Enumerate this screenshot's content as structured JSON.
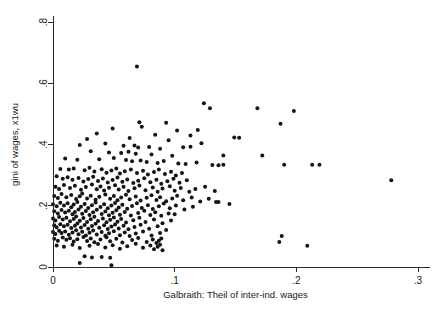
{
  "chart_data": {
    "type": "scatter",
    "title": "",
    "subtitle": "",
    "xlabel": "Galbraith: Theil of inter-ind. wages",
    "ylabel": "gini of wages, x1wu",
    "xlim": [
      0,
      0.3
    ],
    "ylim": [
      0,
      0.8
    ],
    "xticks": [
      0,
      0.1,
      0.2,
      0.3
    ],
    "xticklabels": [
      "0",
      ".1",
      ".2",
      ".3"
    ],
    "yticks": [
      0,
      0.2,
      0.4,
      0.6,
      0.8
    ],
    "yticklabels": [
      "0",
      ".2",
      ".4",
      ".6",
      ".8"
    ],
    "grid": false,
    "legend": null,
    "marker": "circle",
    "marker_color": "#151515",
    "marker_size": 4,
    "n_points": 362,
    "annotations": [],
    "points": [
      [
        0.069,
        0.655
      ],
      [
        0.124,
        0.535
      ],
      [
        0.129,
        0.518
      ],
      [
        0.168,
        0.518
      ],
      [
        0.198,
        0.509
      ],
      [
        0.187,
        0.468
      ],
      [
        0.071,
        0.473
      ],
      [
        0.093,
        0.471
      ],
      [
        0.049,
        0.452
      ],
      [
        0.073,
        0.458
      ],
      [
        0.102,
        0.446
      ],
      [
        0.119,
        0.447
      ],
      [
        0.036,
        0.436
      ],
      [
        0.084,
        0.432
      ],
      [
        0.113,
        0.429
      ],
      [
        0.149,
        0.423
      ],
      [
        0.153,
        0.422
      ],
      [
        0.028,
        0.418
      ],
      [
        0.063,
        0.421
      ],
      [
        0.095,
        0.414
      ],
      [
        0.122,
        0.404
      ],
      [
        0.022,
        0.398
      ],
      [
        0.043,
        0.403
      ],
      [
        0.058,
        0.396
      ],
      [
        0.067,
        0.397
      ],
      [
        0.07,
        0.39
      ],
      [
        0.079,
        0.392
      ],
      [
        0.088,
        0.386
      ],
      [
        0.107,
        0.391
      ],
      [
        0.113,
        0.393
      ],
      [
        0.031,
        0.378
      ],
      [
        0.046,
        0.374
      ],
      [
        0.056,
        0.372
      ],
      [
        0.062,
        0.376
      ],
      [
        0.068,
        0.37
      ],
      [
        0.081,
        0.367
      ],
      [
        0.098,
        0.363
      ],
      [
        0.14,
        0.364
      ],
      [
        0.172,
        0.364
      ],
      [
        0.01,
        0.354
      ],
      [
        0.02,
        0.35
      ],
      [
        0.038,
        0.352
      ],
      [
        0.05,
        0.356
      ],
      [
        0.06,
        0.349
      ],
      [
        0.065,
        0.345
      ],
      [
        0.072,
        0.348
      ],
      [
        0.077,
        0.343
      ],
      [
        0.086,
        0.34
      ],
      [
        0.091,
        0.346
      ],
      [
        0.103,
        0.338
      ],
      [
        0.109,
        0.336
      ],
      [
        0.118,
        0.341
      ],
      [
        0.006,
        0.32
      ],
      [
        0.013,
        0.318
      ],
      [
        0.017,
        0.322
      ],
      [
        0.026,
        0.316
      ],
      [
        0.03,
        0.324
      ],
      [
        0.034,
        0.312
      ],
      [
        0.04,
        0.319
      ],
      [
        0.044,
        0.308
      ],
      [
        0.048,
        0.315
      ],
      [
        0.052,
        0.322
      ],
      [
        0.055,
        0.305
      ],
      [
        0.059,
        0.313
      ],
      [
        0.064,
        0.318
      ],
      [
        0.069,
        0.307
      ],
      [
        0.074,
        0.314
      ],
      [
        0.078,
        0.302
      ],
      [
        0.083,
        0.31
      ],
      [
        0.087,
        0.318
      ],
      [
        0.092,
        0.304
      ],
      [
        0.097,
        0.311
      ],
      [
        0.101,
        0.299
      ],
      [
        0.106,
        0.307
      ],
      [
        0.131,
        0.333
      ],
      [
        0.136,
        0.332
      ],
      [
        0.14,
        0.334
      ],
      [
        0.19,
        0.334
      ],
      [
        0.213,
        0.334
      ],
      [
        0.219,
        0.334
      ],
      [
        0.278,
        0.283
      ],
      [
        0.003,
        0.296
      ],
      [
        0.008,
        0.288
      ],
      [
        0.012,
        0.293
      ],
      [
        0.016,
        0.285
      ],
      [
        0.021,
        0.291
      ],
      [
        0.025,
        0.279
      ],
      [
        0.029,
        0.287
      ],
      [
        0.033,
        0.295
      ],
      [
        0.037,
        0.281
      ],
      [
        0.041,
        0.289
      ],
      [
        0.045,
        0.276
      ],
      [
        0.049,
        0.284
      ],
      [
        0.053,
        0.292
      ],
      [
        0.057,
        0.278
      ],
      [
        0.061,
        0.286
      ],
      [
        0.066,
        0.274
      ],
      [
        0.07,
        0.282
      ],
      [
        0.075,
        0.29
      ],
      [
        0.08,
        0.277
      ],
      [
        0.085,
        0.285
      ],
      [
        0.089,
        0.272
      ],
      [
        0.094,
        0.28
      ],
      [
        0.099,
        0.288
      ],
      [
        0.104,
        0.275
      ],
      [
        0.11,
        0.283
      ],
      [
        0.002,
        0.262
      ],
      [
        0.005,
        0.255
      ],
      [
        0.009,
        0.268
      ],
      [
        0.014,
        0.258
      ],
      [
        0.018,
        0.265
      ],
      [
        0.023,
        0.252
      ],
      [
        0.027,
        0.261
      ],
      [
        0.032,
        0.269
      ],
      [
        0.036,
        0.254
      ],
      [
        0.039,
        0.263
      ],
      [
        0.042,
        0.25
      ],
      [
        0.046,
        0.259
      ],
      [
        0.051,
        0.267
      ],
      [
        0.054,
        0.253
      ],
      [
        0.058,
        0.262
      ],
      [
        0.062,
        0.248
      ],
      [
        0.067,
        0.257
      ],
      [
        0.071,
        0.266
      ],
      [
        0.076,
        0.251
      ],
      [
        0.082,
        0.26
      ],
      [
        0.086,
        0.246
      ],
      [
        0.09,
        0.256
      ],
      [
        0.096,
        0.264
      ],
      [
        0.1,
        0.249
      ],
      [
        0.105,
        0.258
      ],
      [
        0.112,
        0.246
      ],
      [
        0.117,
        0.255
      ],
      [
        0.125,
        0.262
      ],
      [
        0.133,
        0.248
      ],
      [
        0.001,
        0.232
      ],
      [
        0.004,
        0.225
      ],
      [
        0.007,
        0.238
      ],
      [
        0.011,
        0.228
      ],
      [
        0.015,
        0.235
      ],
      [
        0.019,
        0.222
      ],
      [
        0.022,
        0.231
      ],
      [
        0.024,
        0.24
      ],
      [
        0.028,
        0.224
      ],
      [
        0.031,
        0.233
      ],
      [
        0.035,
        0.22
      ],
      [
        0.038,
        0.229
      ],
      [
        0.043,
        0.237
      ],
      [
        0.047,
        0.223
      ],
      [
        0.05,
        0.232
      ],
      [
        0.053,
        0.218
      ],
      [
        0.056,
        0.227
      ],
      [
        0.06,
        0.236
      ],
      [
        0.063,
        0.221
      ],
      [
        0.068,
        0.23
      ],
      [
        0.072,
        0.217
      ],
      [
        0.077,
        0.226
      ],
      [
        0.081,
        0.234
      ],
      [
        0.085,
        0.219
      ],
      [
        0.088,
        0.228
      ],
      [
        0.093,
        0.215
      ],
      [
        0.098,
        0.224
      ],
      [
        0.102,
        0.233
      ],
      [
        0.107,
        0.218
      ],
      [
        0.114,
        0.227
      ],
      [
        0.121,
        0.214
      ],
      [
        0.128,
        0.223
      ],
      [
        0.136,
        0.212
      ],
      [
        0.145,
        0.206
      ],
      [
        0.134,
        0.212
      ],
      [
        0.0,
        0.205
      ],
      [
        0.003,
        0.198
      ],
      [
        0.006,
        0.21
      ],
      [
        0.009,
        0.201
      ],
      [
        0.012,
        0.208
      ],
      [
        0.015,
        0.195
      ],
      [
        0.017,
        0.204
      ],
      [
        0.02,
        0.212
      ],
      [
        0.023,
        0.197
      ],
      [
        0.026,
        0.206
      ],
      [
        0.029,
        0.193
      ],
      [
        0.032,
        0.202
      ],
      [
        0.035,
        0.211
      ],
      [
        0.039,
        0.196
      ],
      [
        0.042,
        0.205
      ],
      [
        0.045,
        0.192
      ],
      [
        0.048,
        0.201
      ],
      [
        0.051,
        0.209
      ],
      [
        0.054,
        0.194
      ],
      [
        0.057,
        0.203
      ],
      [
        0.061,
        0.19
      ],
      [
        0.065,
        0.199
      ],
      [
        0.069,
        0.208
      ],
      [
        0.073,
        0.193
      ],
      [
        0.078,
        0.202
      ],
      [
        0.082,
        0.189
      ],
      [
        0.087,
        0.198
      ],
      [
        0.091,
        0.207
      ],
      [
        0.096,
        0.192
      ],
      [
        0.101,
        0.201
      ],
      [
        0.108,
        0.188
      ],
      [
        0.115,
        0.197
      ],
      [
        0.001,
        0.182
      ],
      [
        0.004,
        0.175
      ],
      [
        0.007,
        0.186
      ],
      [
        0.01,
        0.178
      ],
      [
        0.013,
        0.184
      ],
      [
        0.016,
        0.172
      ],
      [
        0.018,
        0.18
      ],
      [
        0.021,
        0.188
      ],
      [
        0.024,
        0.174
      ],
      [
        0.027,
        0.183
      ],
      [
        0.03,
        0.17
      ],
      [
        0.033,
        0.179
      ],
      [
        0.036,
        0.187
      ],
      [
        0.04,
        0.173
      ],
      [
        0.043,
        0.181
      ],
      [
        0.046,
        0.169
      ],
      [
        0.049,
        0.177
      ],
      [
        0.052,
        0.185
      ],
      [
        0.055,
        0.171
      ],
      [
        0.059,
        0.18
      ],
      [
        0.064,
        0.168
      ],
      [
        0.07,
        0.176
      ],
      [
        0.075,
        0.184
      ],
      [
        0.08,
        0.17
      ],
      [
        0.084,
        0.179
      ],
      [
        0.089,
        0.167
      ],
      [
        0.095,
        0.175
      ],
      [
        0.1,
        0.172
      ],
      [
        0.0,
        0.158
      ],
      [
        0.002,
        0.152
      ],
      [
        0.005,
        0.163
      ],
      [
        0.008,
        0.155
      ],
      [
        0.011,
        0.161
      ],
      [
        0.014,
        0.149
      ],
      [
        0.017,
        0.157
      ],
      [
        0.019,
        0.165
      ],
      [
        0.022,
        0.151
      ],
      [
        0.025,
        0.16
      ],
      [
        0.028,
        0.147
      ],
      [
        0.031,
        0.156
      ],
      [
        0.034,
        0.164
      ],
      [
        0.037,
        0.15
      ],
      [
        0.041,
        0.158
      ],
      [
        0.044,
        0.146
      ],
      [
        0.047,
        0.154
      ],
      [
        0.05,
        0.162
      ],
      [
        0.053,
        0.148
      ],
      [
        0.056,
        0.157
      ],
      [
        0.06,
        0.145
      ],
      [
        0.066,
        0.153
      ],
      [
        0.071,
        0.161
      ],
      [
        0.076,
        0.147
      ],
      [
        0.083,
        0.155
      ],
      [
        0.09,
        0.143
      ],
      [
        0.097,
        0.152
      ],
      [
        0.001,
        0.136
      ],
      [
        0.003,
        0.13
      ],
      [
        0.006,
        0.14
      ],
      [
        0.009,
        0.133
      ],
      [
        0.012,
        0.138
      ],
      [
        0.015,
        0.127
      ],
      [
        0.018,
        0.135
      ],
      [
        0.02,
        0.142
      ],
      [
        0.023,
        0.129
      ],
      [
        0.026,
        0.137
      ],
      [
        0.029,
        0.125
      ],
      [
        0.032,
        0.134
      ],
      [
        0.035,
        0.141
      ],
      [
        0.038,
        0.128
      ],
      [
        0.042,
        0.136
      ],
      [
        0.045,
        0.124
      ],
      [
        0.048,
        0.132
      ],
      [
        0.051,
        0.139
      ],
      [
        0.054,
        0.126
      ],
      [
        0.058,
        0.135
      ],
      [
        0.062,
        0.123
      ],
      [
        0.067,
        0.131
      ],
      [
        0.072,
        0.138
      ],
      [
        0.079,
        0.125
      ],
      [
        0.086,
        0.133
      ],
      [
        0.093,
        0.121
      ],
      [
        0.0,
        0.114
      ],
      [
        0.002,
        0.108
      ],
      [
        0.005,
        0.118
      ],
      [
        0.007,
        0.111
      ],
      [
        0.01,
        0.116
      ],
      [
        0.013,
        0.105
      ],
      [
        0.016,
        0.113
      ],
      [
        0.019,
        0.12
      ],
      [
        0.021,
        0.107
      ],
      [
        0.024,
        0.115
      ],
      [
        0.027,
        0.103
      ],
      [
        0.03,
        0.112
      ],
      [
        0.033,
        0.119
      ],
      [
        0.036,
        0.106
      ],
      [
        0.04,
        0.114
      ],
      [
        0.043,
        0.102
      ],
      [
        0.046,
        0.11
      ],
      [
        0.05,
        0.117
      ],
      [
        0.055,
        0.104
      ],
      [
        0.059,
        0.113
      ],
      [
        0.063,
        0.101
      ],
      [
        0.068,
        0.109
      ],
      [
        0.074,
        0.116
      ],
      [
        0.081,
        0.103
      ],
      [
        0.088,
        0.111
      ],
      [
        0.001,
        0.092
      ],
      [
        0.004,
        0.086
      ],
      [
        0.008,
        0.096
      ],
      [
        0.011,
        0.089
      ],
      [
        0.014,
        0.094
      ],
      [
        0.017,
        0.083
      ],
      [
        0.02,
        0.091
      ],
      [
        0.025,
        0.098
      ],
      [
        0.028,
        0.085
      ],
      [
        0.031,
        0.093
      ],
      [
        0.034,
        0.081
      ],
      [
        0.039,
        0.09
      ],
      [
        0.044,
        0.097
      ],
      [
        0.047,
        0.084
      ],
      [
        0.052,
        0.092
      ],
      [
        0.057,
        0.08
      ],
      [
        0.065,
        0.088
      ],
      [
        0.07,
        0.095
      ],
      [
        0.077,
        0.082
      ],
      [
        0.082,
        0.09
      ],
      [
        0.085,
        0.078
      ],
      [
        0.087,
        0.086
      ],
      [
        0.089,
        0.093
      ],
      [
        0.188,
        0.101
      ],
      [
        0.186,
        0.082
      ],
      [
        0.209,
        0.069
      ],
      [
        0.003,
        0.07
      ],
      [
        0.009,
        0.066
      ],
      [
        0.016,
        0.073
      ],
      [
        0.022,
        0.062
      ],
      [
        0.03,
        0.069
      ],
      [
        0.037,
        0.075
      ],
      [
        0.043,
        0.064
      ],
      [
        0.049,
        0.071
      ],
      [
        0.055,
        0.06
      ],
      [
        0.061,
        0.068
      ],
      [
        0.068,
        0.076
      ],
      [
        0.074,
        0.063
      ],
      [
        0.08,
        0.07
      ],
      [
        0.083,
        0.058
      ],
      [
        0.086,
        0.066
      ],
      [
        0.088,
        0.073
      ],
      [
        0.09,
        0.055
      ],
      [
        0.026,
        0.035
      ],
      [
        0.032,
        0.031
      ],
      [
        0.04,
        0.033
      ],
      [
        0.047,
        0.03
      ],
      [
        0.022,
        0.013
      ],
      [
        0.048,
        0.006
      ]
    ]
  },
  "figure": {
    "background_color": "#ffffff",
    "axis_color": "#2b2b2b",
    "text_color": "#1a1a1a"
  }
}
